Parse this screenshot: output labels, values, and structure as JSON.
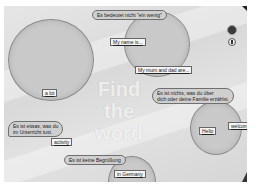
{
  "game": {
    "title_line1": "Find",
    "title_line2": "the word"
  },
  "clues": [
    {
      "id": "clue-1",
      "text": "Es bedeutet nicht \"ein wenig\""
    },
    {
      "id": "clue-2",
      "line1": "Es ist nichts, was du über",
      "line2": "dich oder deine Familie erzählst."
    },
    {
      "id": "clue-3",
      "line1": "Es ist etwas, was du",
      "line2": "im Unterricht tust."
    },
    {
      "id": "clue-4",
      "text": "Es ist keine Begrüßung"
    }
  ],
  "answers": [
    {
      "id": "answer-a",
      "text": "a lot"
    },
    {
      "id": "answer-b",
      "text": "My name is..."
    },
    {
      "id": "answer-c",
      "text": "My mum and dad are..."
    },
    {
      "id": "answer-d",
      "text": "Hello"
    },
    {
      "id": "answer-e",
      "text": "welcome"
    },
    {
      "id": "answer-f",
      "text": "activity"
    },
    {
      "id": "answer-g",
      "text": "in Germany"
    }
  ],
  "controls": {
    "top_button": "close-button",
    "second_button": "info-button"
  }
}
